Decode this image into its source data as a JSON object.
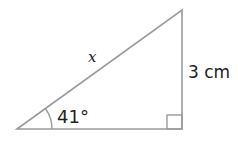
{
  "diagram": {
    "type": "right-triangle",
    "hypotenuse_label": "x",
    "angle_label": "41°",
    "opposite_side_label": "3 cm",
    "right_angle_marker": true,
    "colors": {
      "line": "#9a9a9a",
      "text": "#222222",
      "background": "#ffffff"
    }
  }
}
